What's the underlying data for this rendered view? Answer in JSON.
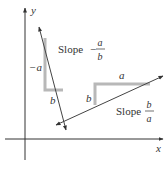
{
  "diagram": {
    "axes": {
      "x_label": "x",
      "y_label": "y"
    },
    "line_negative": {
      "slope_word": "Slope",
      "sign": "−",
      "numerator": "a",
      "denominator": "b",
      "rise_label": "−a",
      "run_label": "b"
    },
    "line_positive": {
      "slope_word": "Slope",
      "numerator": "b",
      "denominator": "a",
      "rise_label": "b",
      "run_label": "a"
    },
    "colors": {
      "axis": "#333333",
      "line": "#444444",
      "triangle": "#b8b8b8"
    }
  }
}
